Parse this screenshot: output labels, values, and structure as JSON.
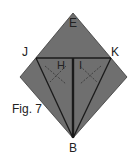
{
  "figure": {
    "caption": "Fig. 7",
    "colors": {
      "paper": "#6f6f6f",
      "line": "#1a1a1a",
      "fold_mark": "#444444",
      "background": "#ffffff"
    }
  },
  "labels": {
    "top": "E",
    "left": "J",
    "right": "K",
    "bottom": "B",
    "inner_left": "H",
    "inner_right": "I"
  }
}
